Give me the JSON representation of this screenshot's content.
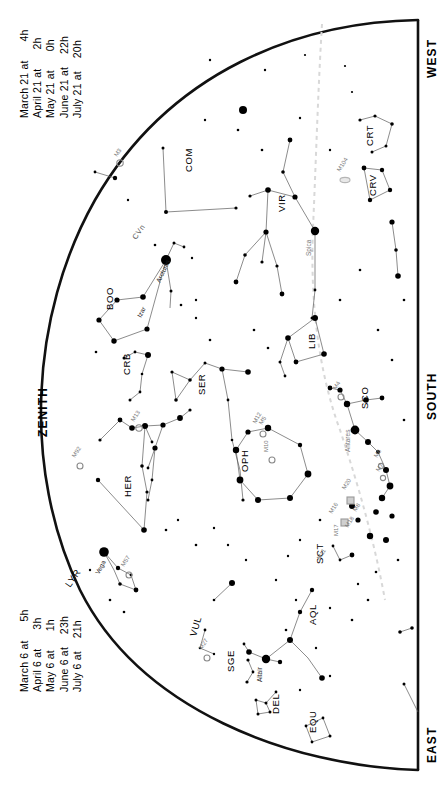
{
  "chart_title": "Star chart — southern horizon sky map",
  "cardinals": [
    {
      "id": "west",
      "label": "WEST"
    },
    {
      "id": "south",
      "label": "SOUTH"
    },
    {
      "id": "east",
      "label": "EAST"
    },
    {
      "id": "zenith",
      "label": "ZENITH"
    }
  ],
  "dates_top": {
    "rows": [
      {
        "date": "March 21 at",
        "time": "4h"
      },
      {
        "date": "April 21 at",
        "time": "2h"
      },
      {
        "date": "May 21 at",
        "time": "0h"
      },
      {
        "date": "June 21 at",
        "time": "22h"
      },
      {
        "date": "July 21 at",
        "time": "20h"
      }
    ]
  },
  "dates_bottom": {
    "rows": [
      {
        "date": "March 6 at",
        "time": "5h"
      },
      {
        "date": "April 6 at",
        "time": "3h"
      },
      {
        "date": "May 6 at",
        "time": "1h"
      },
      {
        "date": "June 6 at",
        "time": "23h"
      },
      {
        "date": "July 6 at",
        "time": "21h"
      }
    ]
  },
  "colors": {
    "ink": "#000000",
    "horizon": "#111111",
    "constellation_line": "#555555",
    "ecliptic": "#d8d8d8",
    "messier": "#888888",
    "highlight_box": "#cfcfcf"
  },
  "chart_data": {
    "type": "scatter",
    "xlabel": "",
    "ylabel": "",
    "xlim": [
      0,
      440
    ],
    "ylim": [
      0,
      790
    ],
    "grid": false,
    "legend": "none",
    "projection": "half-dome horizon (rotated 90°)",
    "constellations": [
      {
        "abbr": "COM",
        "name": "Coma Berenices",
        "x": 192,
        "y": 172
      },
      {
        "abbr": "CVn",
        "name": "Canes Venatici",
        "x": 140,
        "y": 228
      },
      {
        "abbr": "BOO",
        "name": "Bootes",
        "x": 113,
        "y": 310
      },
      {
        "abbr": "CRB",
        "name": "Corona Borealis",
        "x": 130,
        "y": 375
      },
      {
        "abbr": "SER",
        "name": "Serpens",
        "x": 205,
        "y": 395
      },
      {
        "abbr": "HER",
        "name": "Hercules",
        "x": 131,
        "y": 497
      },
      {
        "abbr": "LYR",
        "name": "Lyra",
        "x": 73,
        "y": 572
      },
      {
        "abbr": "VUL",
        "name": "Vulpecula",
        "x": 196,
        "y": 637
      },
      {
        "abbr": "SGE",
        "name": "Sagitta",
        "x": 234,
        "y": 672
      },
      {
        "abbr": "DEL",
        "name": "Delphinus",
        "x": 279,
        "y": 714
      },
      {
        "abbr": "EQU",
        "name": "Equuleus",
        "x": 316,
        "y": 733
      },
      {
        "abbr": "AQL",
        "name": "Aquila",
        "x": 316,
        "y": 625
      },
      {
        "abbr": "SCT",
        "name": "Scutum",
        "x": 323,
        "y": 564
      },
      {
        "abbr": "OPH",
        "name": "Ophiuchus",
        "x": 248,
        "y": 472
      },
      {
        "abbr": "SCO",
        "name": "Scorpius",
        "x": 368,
        "y": 409
      },
      {
        "abbr": "LIB",
        "name": "Libra",
        "x": 315,
        "y": 349
      },
      {
        "abbr": "VIR",
        "name": "Virgo",
        "x": 285,
        "y": 212
      },
      {
        "abbr": "CRV",
        "name": "Corvus",
        "x": 376,
        "y": 190
      },
      {
        "abbr": "CRT",
        "name": "Crater",
        "x": 373,
        "y": 140
      }
    ],
    "named_stars": [
      {
        "name": "Arcturus",
        "x": 166,
        "y": 260,
        "mag": 0.0
      },
      {
        "name": "Izar",
        "x": 143,
        "y": 297,
        "mag": 2.4
      },
      {
        "name": "Vega",
        "x": 104,
        "y": 552,
        "mag": 0.0
      },
      {
        "name": "Altair",
        "x": 266,
        "y": 659,
        "mag": 0.8
      },
      {
        "name": "Spica",
        "x": 315,
        "y": 231,
        "mag": 1.0
      },
      {
        "name": "Antares",
        "x": 355,
        "y": 430,
        "mag": 1.0
      }
    ],
    "messier_objects": [
      {
        "name": "M3",
        "x": 120,
        "y": 163
      },
      {
        "name": "M13",
        "x": 139,
        "y": 428
      },
      {
        "name": "M92",
        "x": 80,
        "y": 466
      },
      {
        "name": "M5",
        "x": 258,
        "y": 430
      },
      {
        "name": "M12",
        "x": 263,
        "y": 434
      },
      {
        "name": "M10",
        "x": 272,
        "y": 460
      },
      {
        "name": "M57",
        "x": 129,
        "y": 575
      },
      {
        "name": "M27",
        "x": 207,
        "y": 658
      },
      {
        "name": "M4",
        "x": 341,
        "y": 397
      },
      {
        "name": "M6",
        "x": 381,
        "y": 466
      },
      {
        "name": "M7",
        "x": 383,
        "y": 478
      },
      {
        "name": "M8",
        "x": 352,
        "y": 505
      },
      {
        "name": "M20",
        "x": 352,
        "y": 498
      },
      {
        "name": "M11",
        "x": 347,
        "y": 525
      },
      {
        "name": "M16",
        "x": 345,
        "y": 521
      },
      {
        "name": "M17",
        "x": 343,
        "y": 529
      },
      {
        "name": "M18",
        "x": 344,
        "y": 533
      },
      {
        "name": "M104",
        "x": 345,
        "y": 180
      }
    ],
    "ecliptic": {
      "style": "dashed",
      "color": "#d8d8d8",
      "path": "from north-west limb through Spica, Libra, Antares to Sagittarius"
    }
  }
}
